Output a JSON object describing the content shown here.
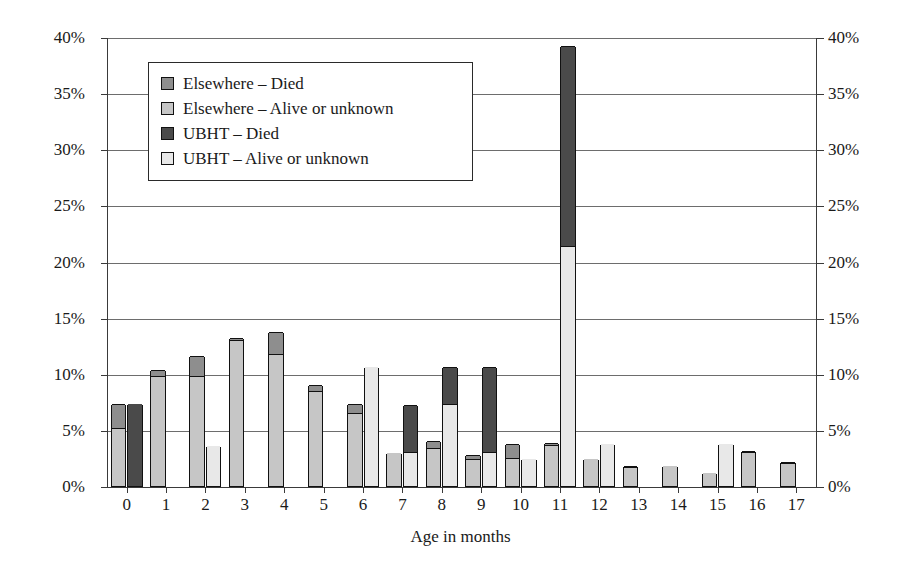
{
  "chart_data": {
    "type": "bar",
    "title": "",
    "subtitle": "",
    "xlabel": "Age in months",
    "ylabel": "Percentage",
    "ylim": [
      0,
      40
    ],
    "ytick_labels": [
      "0%",
      "5%",
      "10%",
      "15%",
      "20%",
      "25%",
      "30%",
      "35%",
      "40%"
    ],
    "ytick_values": [
      0,
      5,
      10,
      15,
      20,
      25,
      30,
      35,
      40
    ],
    "grid": true,
    "dual_y_axis": true,
    "legend_position": "upper-left-inside",
    "stacked": true,
    "grouped": true,
    "categories": [
      "0",
      "1",
      "2",
      "3",
      "4",
      "5",
      "6",
      "7",
      "8",
      "9",
      "10",
      "11",
      "12",
      "13",
      "14",
      "15",
      "16",
      "17"
    ],
    "series": [
      {
        "name": "Elsewhere – Alive or unknown",
        "group": "Elsewhere",
        "stack_order": 1,
        "color": "#c6c6c6",
        "values": [
          5.1,
          9.7,
          9.7,
          12.9,
          11.7,
          8.4,
          6.4,
          2.9,
          3.3,
          2.3,
          2.4,
          3.6,
          2.4,
          1.6,
          1.8,
          1.2,
          2.9,
          2.0
        ]
      },
      {
        "name": "Elsewhere – Died",
        "group": "Elsewhere",
        "stack_order": 2,
        "color": "#8e8e8e",
        "values": [
          2.2,
          0.6,
          1.9,
          0.3,
          2.0,
          0.6,
          0.9,
          0.0,
          0.7,
          0.5,
          1.3,
          0.2,
          0.0,
          0.2,
          0.0,
          0.0,
          0.2,
          0.1
        ]
      },
      {
        "name": "UBHT – Alive or unknown",
        "group": "UBHT",
        "stack_order": 1,
        "color": "#e8e8e8",
        "values": [
          0.0,
          0.0,
          3.6,
          0.0,
          0.0,
          0.0,
          10.6,
          2.9,
          7.2,
          2.9,
          2.4,
          21.3,
          3.7,
          0.0,
          0.0,
          3.7,
          0.0,
          0.0
        ]
      },
      {
        "name": "UBHT – Died",
        "group": "UBHT",
        "stack_order": 2,
        "color": "#4a4a4a",
        "values": [
          7.3,
          0.0,
          0.0,
          0.0,
          0.0,
          0.0,
          0.0,
          4.3,
          3.4,
          7.7,
          0.0,
          17.9,
          0.0,
          0.0,
          0.0,
          0.0,
          0.0,
          0.0
        ]
      }
    ],
    "totals": {
      "Elsewhere": [
        7.3,
        10.3,
        11.6,
        13.2,
        13.7,
        9.0,
        7.3,
        2.9,
        4.0,
        2.8,
        3.7,
        3.8,
        2.4,
        1.8,
        1.8,
        1.2,
        3.1,
        2.1
      ],
      "UBHT": [
        7.3,
        0.0,
        3.6,
        0.0,
        0.0,
        0.0,
        10.6,
        7.2,
        10.6,
        10.6,
        2.4,
        39.2,
        3.7,
        0.0,
        0.0,
        3.7,
        0.0,
        0.0
      ]
    }
  },
  "legend": {
    "items": [
      {
        "label": "Elsewhere – Died",
        "color": "#8e8e8e"
      },
      {
        "label": "Elsewhere – Alive or unknown",
        "color": "#c6c6c6"
      },
      {
        "label": "UBHT – Died",
        "color": "#4a4a4a"
      },
      {
        "label": "UBHT – Alive or unknown",
        "color": "#e8e8e8"
      }
    ]
  },
  "axes": {
    "y_title": "Percentage",
    "x_title": "Age in months"
  }
}
